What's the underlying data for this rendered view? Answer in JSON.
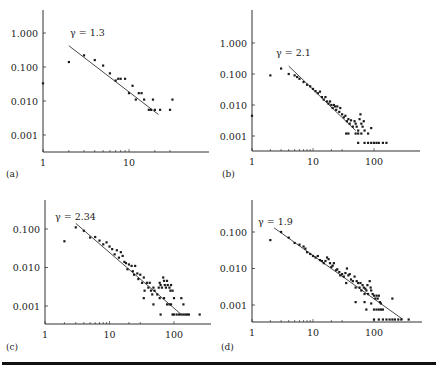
{
  "chart_data": [
    {
      "type": "scatter",
      "panel_label": "(a)",
      "title": "",
      "xlabel": "",
      "ylabel": "",
      "xscale": "log",
      "yscale": "log",
      "x_ticks": [
        "1",
        "10"
      ],
      "y_ticks": [
        "1.000",
        "0.100",
        "0.010",
        "0.001"
      ],
      "annotation": "γ = 1.3",
      "fit": {
        "gamma": 1.3,
        "x_start": 2,
        "x_end": 22,
        "y_start": 0.42,
        "y_end": 0.004
      },
      "points": [
        [
          1,
          0.033
        ],
        [
          2,
          0.14
        ],
        [
          3,
          0.22
        ],
        [
          4,
          0.16
        ],
        [
          5,
          0.11
        ],
        [
          6,
          0.065
        ],
        [
          7,
          0.04
        ],
        [
          7.5,
          0.045
        ],
        [
          8,
          0.045
        ],
        [
          9,
          0.045
        ],
        [
          10,
          0.017
        ],
        [
          11,
          0.028
        ],
        [
          12,
          0.011
        ],
        [
          13,
          0.017
        ],
        [
          14,
          0.017
        ],
        [
          15,
          0.011
        ],
        [
          17,
          0.0055
        ],
        [
          18,
          0.0055
        ],
        [
          19,
          0.011
        ],
        [
          20,
          0.0055
        ],
        [
          23,
          0.0055
        ],
        [
          30,
          0.0055
        ],
        [
          32,
          0.011
        ]
      ],
      "grid": false,
      "legend": null
    },
    {
      "type": "scatter",
      "panel_label": "(b)",
      "title": "",
      "xlabel": "",
      "ylabel": "",
      "xscale": "log",
      "yscale": "log",
      "x_ticks": [
        "1",
        "10",
        "100"
      ],
      "y_ticks": [
        "1.000",
        "0.100",
        "0.010",
        "0.001"
      ],
      "annotation": "γ = 2.1",
      "fit": {
        "gamma": 2.1,
        "x_start": 4,
        "x_end": 50,
        "y_start": 0.18,
        "y_end": 0.0015
      },
      "points": [
        [
          1,
          0.0045
        ],
        [
          2,
          0.09
        ],
        [
          3,
          0.15
        ],
        [
          4,
          0.1
        ],
        [
          5,
          0.09
        ],
        [
          5.5,
          0.08
        ],
        [
          6,
          0.07
        ],
        [
          7,
          0.055
        ],
        [
          8,
          0.045
        ],
        [
          9,
          0.04
        ],
        [
          10,
          0.033
        ],
        [
          11,
          0.028
        ],
        [
          12,
          0.024
        ],
        [
          13,
          0.027
        ],
        [
          14,
          0.018
        ],
        [
          15,
          0.015
        ],
        [
          16,
          0.018
        ],
        [
          17,
          0.013
        ],
        [
          18,
          0.011
        ],
        [
          19,
          0.013
        ],
        [
          20,
          0.01
        ],
        [
          21,
          0.008
        ],
        [
          22,
          0.01
        ],
        [
          23,
          0.009
        ],
        [
          24,
          0.007
        ],
        [
          25,
          0.009
        ],
        [
          27,
          0.006
        ],
        [
          28,
          0.008
        ],
        [
          30,
          0.005
        ],
        [
          32,
          0.004
        ],
        [
          34,
          0.0045
        ],
        [
          36,
          0.003
        ],
        [
          38,
          0.0035
        ],
        [
          40,
          0.0025
        ],
        [
          42,
          0.0032
        ],
        [
          45,
          0.002
        ],
        [
          48,
          0.003
        ],
        [
          50,
          0.0025
        ],
        [
          52,
          0.002
        ],
        [
          55,
          0.0015
        ],
        [
          58,
          0.0035
        ],
        [
          60,
          0.005
        ],
        [
          62,
          0.0025
        ],
        [
          65,
          0.002
        ],
        [
          68,
          0.003
        ],
        [
          35,
          0.0012
        ],
        [
          38,
          0.0012
        ],
        [
          50,
          0.0012
        ],
        [
          55,
          0.0012
        ],
        [
          62,
          0.0012
        ],
        [
          70,
          0.0015
        ],
        [
          80,
          0.0012
        ],
        [
          90,
          0.0018
        ],
        [
          55,
          0.0006
        ],
        [
          70,
          0.0006
        ],
        [
          80,
          0.0006
        ],
        [
          90,
          0.0006
        ],
        [
          100,
          0.0006
        ],
        [
          110,
          0.0006
        ],
        [
          120,
          0.0006
        ],
        [
          140,
          0.0006
        ],
        [
          160,
          0.0006
        ]
      ],
      "grid": false,
      "legend": null
    },
    {
      "type": "scatter",
      "panel_label": "(c)",
      "title": "",
      "xlabel": "",
      "ylabel": "",
      "xscale": "log",
      "yscale": "log",
      "x_ticks": [
        "1",
        "10",
        "100"
      ],
      "y_ticks": [
        "0.100",
        "0.010",
        "0.001"
      ],
      "annotation": "γ = 2.34",
      "fit": {
        "gamma": 2.34,
        "x_start": 3,
        "x_end": 130,
        "y_start": 0.14,
        "y_end": 0.0006
      },
      "points": [
        [
          2,
          0.048
        ],
        [
          3,
          0.11
        ],
        [
          4,
          0.09
        ],
        [
          5,
          0.06
        ],
        [
          6,
          0.062
        ],
        [
          7,
          0.05
        ],
        [
          8,
          0.04
        ],
        [
          9,
          0.045
        ],
        [
          10,
          0.035
        ],
        [
          11,
          0.03
        ],
        [
          12,
          0.022
        ],
        [
          13,
          0.028
        ],
        [
          14,
          0.018
        ],
        [
          15,
          0.025
        ],
        [
          16,
          0.02
        ],
        [
          17,
          0.014
        ],
        [
          18,
          0.013
        ],
        [
          19,
          0.009
        ],
        [
          20,
          0.012
        ],
        [
          22,
          0.011
        ],
        [
          23,
          0.008
        ],
        [
          24,
          0.0065
        ],
        [
          25,
          0.011
        ],
        [
          27,
          0.007
        ],
        [
          28,
          0.005
        ],
        [
          30,
          0.0065
        ],
        [
          32,
          0.004
        ],
        [
          34,
          0.0055
        ],
        [
          35,
          0.0025
        ],
        [
          38,
          0.004
        ],
        [
          40,
          0.003
        ],
        [
          42,
          0.004
        ],
        [
          44,
          0.0025
        ],
        [
          46,
          0.002
        ],
        [
          48,
          0.003
        ],
        [
          50,
          0.0025
        ],
        [
          55,
          0.002
        ],
        [
          58,
          0.003
        ],
        [
          60,
          0.004
        ],
        [
          62,
          0.0035
        ],
        [
          65,
          0.003
        ],
        [
          68,
          0.0055
        ],
        [
          70,
          0.0045
        ],
        [
          72,
          0.0035
        ],
        [
          75,
          0.003
        ],
        [
          78,
          0.0045
        ],
        [
          80,
          0.0035
        ],
        [
          85,
          0.003
        ],
        [
          88,
          0.0025
        ],
        [
          90,
          0.0035
        ],
        [
          95,
          0.0025
        ],
        [
          34,
          0.0016
        ],
        [
          48,
          0.0011
        ],
        [
          60,
          0.0016
        ],
        [
          70,
          0.0016
        ],
        [
          78,
          0.0011
        ],
        [
          85,
          0.0011
        ],
        [
          90,
          0.0011
        ],
        [
          100,
          0.0016
        ],
        [
          130,
          0.0016
        ],
        [
          140,
          0.0011
        ],
        [
          62,
          0.0006
        ],
        [
          95,
          0.0006
        ],
        [
          100,
          0.0006
        ],
        [
          110,
          0.0006
        ],
        [
          120,
          0.0006
        ],
        [
          130,
          0.0006
        ],
        [
          140,
          0.0006
        ],
        [
          150,
          0.0006
        ],
        [
          160,
          0.0006
        ],
        [
          170,
          0.0006
        ],
        [
          250,
          0.0006
        ]
      ],
      "grid": false,
      "legend": null
    },
    {
      "type": "scatter",
      "panel_label": "(d)",
      "title": "",
      "xlabel": "",
      "ylabel": "",
      "xscale": "log",
      "yscale": "log",
      "x_ticks": [
        "1",
        "10",
        "100"
      ],
      "y_ticks": [
        "0.100",
        "0.010",
        "0.001"
      ],
      "annotation": "γ = 1.9",
      "fit": {
        "gamma": 1.9,
        "x_start": 2.3,
        "x_end": 300,
        "y_start": 0.13,
        "y_end": 0.0004
      },
      "points": [
        [
          2,
          0.06
        ],
        [
          3,
          0.1
        ],
        [
          4,
          0.07
        ],
        [
          5,
          0.05
        ],
        [
          6,
          0.045
        ],
        [
          7,
          0.04
        ],
        [
          7.5,
          0.035
        ],
        [
          8,
          0.028
        ],
        [
          9,
          0.025
        ],
        [
          10,
          0.022
        ],
        [
          11,
          0.02
        ],
        [
          12,
          0.022
        ],
        [
          13,
          0.017
        ],
        [
          14,
          0.016
        ],
        [
          15,
          0.014
        ],
        [
          16,
          0.016
        ],
        [
          17,
          0.02
        ],
        [
          18,
          0.018
        ],
        [
          19,
          0.014
        ],
        [
          20,
          0.011
        ],
        [
          21,
          0.012
        ],
        [
          22,
          0.014
        ],
        [
          24,
          0.009
        ],
        [
          25,
          0.0095
        ],
        [
          27,
          0.008
        ],
        [
          28,
          0.0065
        ],
        [
          30,
          0.007
        ],
        [
          32,
          0.006
        ],
        [
          34,
          0.0075
        ],
        [
          35,
          0.004
        ],
        [
          36,
          0.01
        ],
        [
          38,
          0.0065
        ],
        [
          40,
          0.007
        ],
        [
          42,
          0.005
        ],
        [
          45,
          0.0045
        ],
        [
          48,
          0.006
        ],
        [
          50,
          0.003
        ],
        [
          52,
          0.0045
        ],
        [
          55,
          0.004
        ],
        [
          58,
          0.003
        ],
        [
          60,
          0.004
        ],
        [
          62,
          0.0025
        ],
        [
          65,
          0.0035
        ],
        [
          68,
          0.003
        ],
        [
          70,
          0.002
        ],
        [
          72,
          0.0028
        ],
        [
          75,
          0.0025
        ],
        [
          78,
          0.0035
        ],
        [
          80,
          0.002
        ],
        [
          85,
          0.0045
        ],
        [
          88,
          0.003
        ],
        [
          90,
          0.0025
        ],
        [
          95,
          0.002
        ],
        [
          100,
          0.0018
        ],
        [
          105,
          0.0015
        ],
        [
          110,
          0.0018
        ],
        [
          115,
          0.0015
        ],
        [
          120,
          0.0018
        ],
        [
          125,
          0.0012
        ],
        [
          50,
          0.0012
        ],
        [
          70,
          0.0012
        ],
        [
          90,
          0.0011
        ],
        [
          130,
          0.0011
        ],
        [
          75,
          0.00075
        ],
        [
          100,
          0.00075
        ],
        [
          110,
          0.00075
        ],
        [
          120,
          0.00075
        ],
        [
          130,
          0.00075
        ],
        [
          140,
          0.00075
        ],
        [
          200,
          0.0015
        ],
        [
          100,
          0.0004
        ],
        [
          120,
          0.0004
        ],
        [
          140,
          0.0004
        ],
        [
          160,
          0.0004
        ],
        [
          180,
          0.0004
        ],
        [
          200,
          0.0004
        ],
        [
          220,
          0.0004
        ],
        [
          250,
          0.0004
        ],
        [
          280,
          0.0004
        ],
        [
          370,
          0.0004
        ]
      ],
      "grid": false,
      "legend": null
    }
  ],
  "layout": {
    "panels": [
      {
        "id": "a",
        "x0": 43,
        "x1": 209,
        "yTop": 10,
        "yAxis": 152,
        "pxPerDecX": 86,
        "pxPerDecY": 34,
        "yRef": 33,
        "yRefVal": 1.0,
        "minorTickMaxX": 30,
        "panelLabelX": 6,
        "panelLabelY": 177,
        "gammaX": 70,
        "gammaY": 36,
        "tickLabelY": 166
      },
      {
        "id": "b",
        "x0": 252,
        "x1": 420,
        "yTop": 10,
        "yAxis": 151,
        "pxPerDecX": 61,
        "pxPerDecY": 31,
        "yRef": 43,
        "yRefVal": 1.0,
        "minorTickMaxX": 30,
        "panelLabelX": 222,
        "panelLabelY": 177,
        "gammaX": 276,
        "gammaY": 56,
        "tickLabelY": 165
      },
      {
        "id": "c",
        "x0": 45,
        "x1": 211,
        "yTop": 200,
        "yAxis": 324,
        "pxPerDecX": 64.5,
        "pxPerDecY": 38.5,
        "yRef": 229,
        "yRefVal": 0.1,
        "minorTickMaxX": 30,
        "panelLabelX": 6,
        "panelLabelY": 350,
        "gammaX": 55,
        "gammaY": 220,
        "tickLabelY": 338
      },
      {
        "id": "d",
        "x0": 252,
        "x1": 422,
        "yTop": 200,
        "yAxis": 322,
        "pxPerDecX": 61,
        "pxPerDecY": 36.5,
        "yRef": 232,
        "yRefVal": 0.1,
        "minorTickMaxX": 30,
        "panelLabelX": 221,
        "panelLabelY": 350,
        "gammaX": 258,
        "gammaY": 225,
        "tickLabelY": 336
      }
    ],
    "colors": {
      "ink": "#1a1a1a",
      "background": "#ffffff"
    }
  }
}
